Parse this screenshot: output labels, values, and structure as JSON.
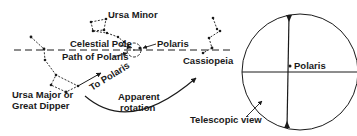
{
  "diagram": {
    "labels": {
      "ursa_minor": "Ursa Minor",
      "celestial_pole": "Celestial Pole",
      "polaris_left": "Polaris",
      "path_of_polaris": "Path of Polaris",
      "cassiopeia": "Cassiopeia",
      "ursa_major_line1": "Ursa Major or",
      "ursa_major_line2": "Great Dipper",
      "to_polaris": "To Polaris",
      "apparent_line1": "Apparent",
      "apparent_line2": "rotation",
      "telescopic_view": "Telescopic view",
      "polaris_right": "Polaris"
    },
    "colors": {
      "ink": "#1a1a1a",
      "background": "#ffffff"
    }
  }
}
